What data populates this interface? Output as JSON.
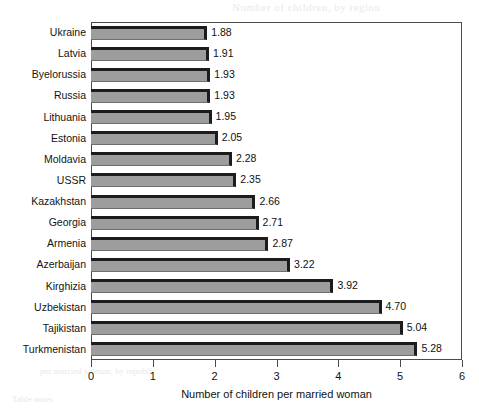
{
  "chart_data": {
    "type": "bar",
    "orientation": "horizontal",
    "title": "",
    "xlabel": "Number of children per married woman",
    "ylabel": "",
    "xlim": [
      0,
      6
    ],
    "xticks": [
      0,
      1,
      2,
      3,
      4,
      5,
      6
    ],
    "xtick_labels": [
      "0",
      "1",
      "2",
      "3",
      "4",
      "5",
      "6"
    ],
    "grid": false,
    "legend": null,
    "value_label_format": "2 decimals",
    "categories": [
      "Ukraine",
      "Latvia",
      "Byelorussia",
      "Russia",
      "Lithuania",
      "Estonia",
      "Moldavia",
      "USSR",
      "Kazakhstan",
      "Georgia",
      "Armenia",
      "Azerbaijan",
      "Kirghizia",
      "Uzbekistan",
      "Tajikistan",
      "Turkmenistan"
    ],
    "values": [
      1.88,
      1.91,
      1.93,
      1.93,
      1.95,
      2.05,
      2.28,
      2.35,
      2.66,
      2.71,
      2.87,
      3.22,
      3.92,
      4.7,
      5.04,
      5.28
    ],
    "value_labels": [
      "1.88",
      "1.91",
      "1.93",
      "1.93",
      "1.95",
      "2.05",
      "2.28",
      "2.35",
      "2.66",
      "2.71",
      "2.87",
      "3.22",
      "3.92",
      "4.70",
      "5.04",
      "5.28"
    ],
    "colors": {
      "bar_fill": "#9d9d9d",
      "bar_edge": "#1c1c1c",
      "frame": "#4a4a4a",
      "background": "#ffffff",
      "text": "#111111"
    }
  },
  "bleed_through": {
    "line1": "Number of children, by region",
    "line2": "Regional fertility",
    "line3": "1.88  1.91  1.93",
    "line4": "2.05  2.28  2.35",
    "line5": "2.66  2.71  2.87",
    "line6": "3.22  3.92  4.70",
    "line7": "5.04  5.28  Total",
    "line8": "Source: census data",
    "line9": "per married woman, by republic",
    "line10": "Table notes"
  }
}
